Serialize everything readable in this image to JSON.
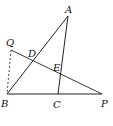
{
  "diagram": {
    "title": "",
    "points": {
      "A": {
        "label": "A",
        "x": 68,
        "y": 16,
        "lx": 65,
        "ly": 13
      },
      "Q": {
        "label": "Q",
        "x": 11,
        "y": 50,
        "lx": 6,
        "ly": 46
      },
      "D": {
        "label": "D",
        "x": 32,
        "y": 61,
        "lx": 28,
        "ly": 57
      },
      "E": {
        "label": "E",
        "x": 61,
        "y": 74,
        "lx": 53,
        "ly": 71
      },
      "B": {
        "label": "B",
        "x": 7,
        "y": 94,
        "lx": 1,
        "ly": 107
      },
      "C": {
        "label": "C",
        "x": 58,
        "y": 94,
        "lx": 53,
        "ly": 108
      },
      "P": {
        "label": "P",
        "x": 102,
        "y": 94,
        "lx": 101,
        "ly": 107
      }
    },
    "segments": [
      {
        "from": "B",
        "to": "A",
        "style": "solid"
      },
      {
        "from": "A",
        "to": "C",
        "style": "solid"
      },
      {
        "from": "B",
        "to": "P",
        "style": "solid"
      },
      {
        "from": "Q",
        "to": "P",
        "style": "solid"
      },
      {
        "from": "Q",
        "to": "B",
        "style": "dashed"
      }
    ],
    "colors": {
      "stroke": "#222222",
      "label": "#111111"
    }
  }
}
